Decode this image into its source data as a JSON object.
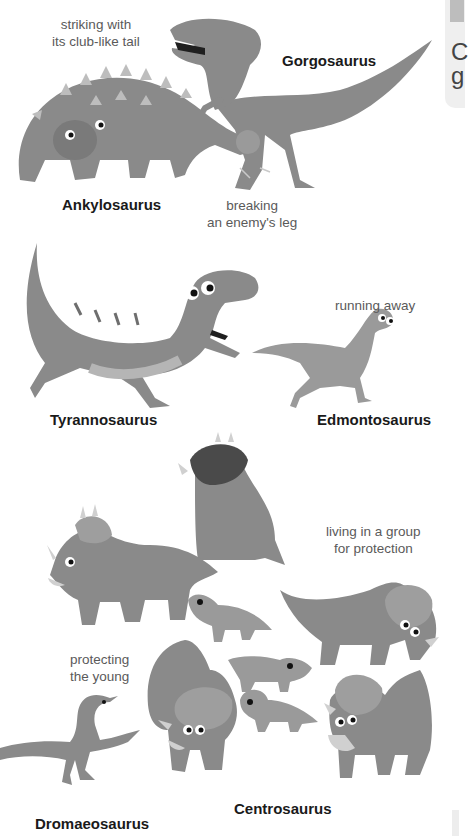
{
  "page": {
    "scenes": [
      {
        "id": "fight",
        "captions": [
          "striking with\nits club-like tail",
          "breaking\nan enemy's leg"
        ],
        "names": [
          "Gorgosaurus",
          "Ankylosaurus"
        ]
      },
      {
        "id": "chase",
        "captions": [
          "running away"
        ],
        "names": [
          "Tyrannosaurus",
          "Edmontosaurus"
        ]
      },
      {
        "id": "herd",
        "captions": [
          "living in a group\nfor protection",
          "protecting\nthe young"
        ],
        "names": [
          "Dromaeosaurus",
          "Centrosaurus"
        ]
      }
    ],
    "labels": {
      "striking": "striking with",
      "striking2": "its club-like tail",
      "gorgosaurus": "Gorgosaurus",
      "ankylosaurus": "Ankylosaurus",
      "breaking": "breaking",
      "breaking2": "an enemy's leg",
      "running": "running away",
      "tyrannosaurus": "Tyrannosaurus",
      "edmontosaurus": "Edmontosaurus",
      "living": "living in a group",
      "living2": "for protection",
      "protecting": "protecting",
      "protecting2": "the young",
      "centrosaurus": "Centrosaurus",
      "dromaeosaurus": "Dromaeosaurus"
    }
  },
  "sidebox": {
    "line1": "C",
    "line2": "g"
  },
  "colors": {
    "dino": "#8a8a8a",
    "dino_dark": "#6a6a6a",
    "dino_light": "#a9a9a9",
    "horn": "#d8d8d8",
    "caption": "#5a5a5a",
    "name": "#1a1a1a"
  }
}
